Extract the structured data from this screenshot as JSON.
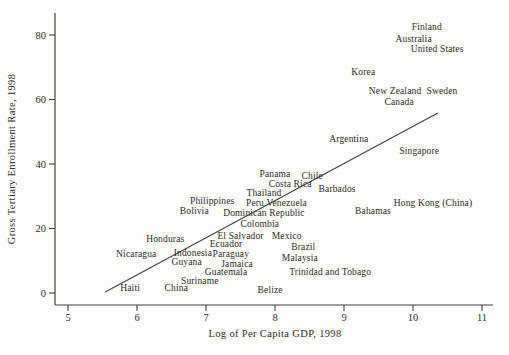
{
  "chart_data": {
    "type": "scatter",
    "title": "",
    "xlabel": "Log of Per Capita GDP, 1998",
    "ylabel": "Gross Tertiary Enrollment Rate, 1998",
    "xlim": [
      4.8,
      11.17
    ],
    "ylim": [
      -3.7,
      87
    ],
    "x_ticks": [
      5,
      6,
      7,
      8,
      9,
      10,
      11
    ],
    "y_ticks": [
      0,
      20,
      40,
      60,
      80
    ],
    "grid": false,
    "legend": null,
    "marker": "country-name-text",
    "points": [
      {
        "label": "Finland",
        "x": 10.2,
        "y": 82.5
      },
      {
        "label": "Australia",
        "x": 10.01,
        "y": 78.8
      },
      {
        "label": "United States",
        "x": 10.35,
        "y": 75.7
      },
      {
        "label": "Korea",
        "x": 9.28,
        "y": 68.5
      },
      {
        "label": "New Zealand",
        "x": 9.74,
        "y": 62.6
      },
      {
        "label": "Sweden",
        "x": 10.42,
        "y": 62.6
      },
      {
        "label": "Canada",
        "x": 9.8,
        "y": 59.2
      },
      {
        "label": "Argentina",
        "x": 9.07,
        "y": 47.8
      },
      {
        "label": "Singapore",
        "x": 10.09,
        "y": 44.0
      },
      {
        "label": "Panama",
        "x": 8.0,
        "y": 36.9
      },
      {
        "label": "Chile",
        "x": 8.54,
        "y": 36.3
      },
      {
        "label": "Costa Rica",
        "x": 8.22,
        "y": 33.8
      },
      {
        "label": "Barbados",
        "x": 8.9,
        "y": 32.2
      },
      {
        "label": "Thailand",
        "x": 7.84,
        "y": 31.0
      },
      {
        "label": "Peru",
        "x": 7.71,
        "y": 27.9
      },
      {
        "label": "Venezuela",
        "x": 8.17,
        "y": 27.9
      },
      {
        "label": "Hong Kong (China)",
        "x": 10.29,
        "y": 27.9
      },
      {
        "label": "Philippines",
        "x": 7.09,
        "y": 28.5
      },
      {
        "label": "Bolivia",
        "x": 6.83,
        "y": 25.4
      },
      {
        "label": "Bahamas",
        "x": 9.42,
        "y": 25.4
      },
      {
        "label": "Dominican Republic",
        "x": 7.84,
        "y": 24.8
      },
      {
        "label": "Colombia",
        "x": 7.78,
        "y": 21.4
      },
      {
        "label": "El Salvador",
        "x": 7.5,
        "y": 17.7
      },
      {
        "label": "Mexico",
        "x": 8.17,
        "y": 17.7
      },
      {
        "label": "Honduras",
        "x": 6.41,
        "y": 16.7
      },
      {
        "label": "Ecuador",
        "x": 7.29,
        "y": 15.2
      },
      {
        "label": "Brazil",
        "x": 8.41,
        "y": 14.3
      },
      {
        "label": "Indonesia",
        "x": 6.81,
        "y": 12.4
      },
      {
        "label": "Nicaragua",
        "x": 5.99,
        "y": 12.1
      },
      {
        "label": "Paraguay",
        "x": 7.36,
        "y": 12.1
      },
      {
        "label": "Malaysia",
        "x": 8.36,
        "y": 10.9
      },
      {
        "label": "Guyana",
        "x": 6.72,
        "y": 9.6
      },
      {
        "label": "Jamaica",
        "x": 7.45,
        "y": 9.0
      },
      {
        "label": "Guatemala",
        "x": 7.29,
        "y": 6.5
      },
      {
        "label": "Trinidad and Tobago",
        "x": 8.8,
        "y": 6.5
      },
      {
        "label": "Suriname",
        "x": 6.91,
        "y": 3.7
      },
      {
        "label": "Haiti",
        "x": 5.9,
        "y": 1.6
      },
      {
        "label": "China",
        "x": 6.57,
        "y": 1.6
      },
      {
        "label": "Belize",
        "x": 7.93,
        "y": 0.9
      }
    ],
    "trend_line": {
      "x1": 5.54,
      "y1": 0.3,
      "x2": 10.36,
      "y2": 55.8
    }
  },
  "colors": {
    "text": "#2f2c28",
    "axis": "#45413b",
    "trend": "#45413b",
    "background": "#fdfdfb"
  }
}
